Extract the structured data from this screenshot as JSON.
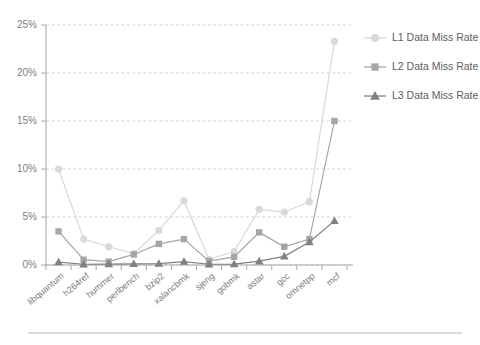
{
  "chart_data": {
    "type": "line",
    "title": "",
    "subtitle": "",
    "xlabel": "",
    "ylabel": "",
    "ylim": [
      0,
      25
    ],
    "yticks": [
      0,
      5,
      10,
      15,
      20,
      25
    ],
    "ytick_labels": [
      "0%",
      "5%",
      "10%",
      "15%",
      "20%",
      "25%"
    ],
    "grid": true,
    "legend_position": "right",
    "categories": [
      "libquantum",
      "h264ref",
      "hummer",
      "perlbench",
      "bzip2",
      "xalancbmk",
      "sjeng",
      "gobmk",
      "astar",
      "gcc",
      "omnetpp",
      "mcf"
    ],
    "series": [
      {
        "name": "L1 Data Miss Rate",
        "color": "#d9d9d9",
        "marker": "circle",
        "values": [
          10.0,
          2.7,
          1.9,
          1.2,
          3.6,
          6.7,
          0.6,
          1.4,
          5.8,
          5.5,
          6.6,
          23.3
        ]
      },
      {
        "name": "L2 Data Miss Rate",
        "color": "#a6a6a6",
        "marker": "square",
        "values": [
          3.5,
          0.55,
          0.35,
          1.1,
          2.2,
          2.7,
          0.4,
          0.85,
          3.4,
          1.9,
          2.7,
          15.0
        ]
      },
      {
        "name": "L3 Data Miss Rate",
        "color": "#808080",
        "marker": "triangle",
        "values": [
          0.3,
          0.08,
          0.1,
          0.12,
          0.15,
          0.35,
          0.08,
          0.1,
          0.4,
          0.9,
          2.4,
          4.6
        ]
      }
    ]
  },
  "legend": {
    "items": [
      {
        "label": "L1 Data Miss Rate"
      },
      {
        "label": "L2 Data Miss Rate"
      },
      {
        "label": "L3 Data Miss Rate"
      }
    ]
  },
  "colors": {
    "l1": "#d9d9d9",
    "l2": "#a6a6a6",
    "l3": "#808080",
    "axis": "#a8a8a8",
    "grid": "#c8c8c8",
    "text": "#6e6e6e",
    "background": "#ffffff"
  }
}
